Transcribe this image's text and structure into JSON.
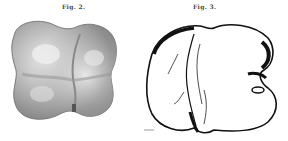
{
  "figures": [
    {
      "caption": "Fig. 2.",
      "style": "shaded",
      "tone_color": "#8a8a8a",
      "highlight_color": "#e6e6e6"
    },
    {
      "caption": "Fig. 3.",
      "style": "line-drawing",
      "ink_color": "#111111"
    }
  ]
}
